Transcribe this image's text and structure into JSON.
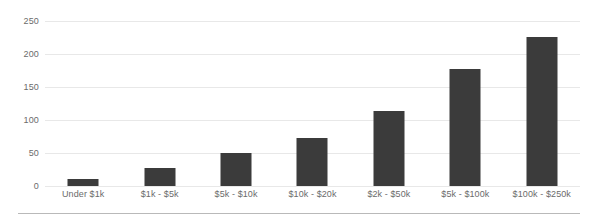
{
  "chart_data": {
    "type": "bar",
    "title": "",
    "subtitle": "",
    "xlabel": "",
    "ylabel": "",
    "categories": [
      "Under $1k",
      "$1k - $5k",
      "$5k - $10k",
      "$10k - $20k",
      "$2k - $50k",
      "$5k - $100k",
      "$100k - $250k"
    ],
    "values": [
      11,
      27,
      50,
      73,
      114,
      178,
      226
    ],
    "ylim": [
      0,
      250
    ],
    "yticks": [
      0,
      50,
      100,
      150,
      200,
      250
    ],
    "ytick_labels": [
      "0",
      "50",
      "100",
      "150",
      "200",
      "250"
    ],
    "grid": true,
    "legend": false,
    "bar_color": "#3b3b3b",
    "gridline_color": "#e8e8e8",
    "axis_text_color": "#6b6b6b",
    "background_color": "#ffffff",
    "rule_color": "#b9b9b9"
  }
}
